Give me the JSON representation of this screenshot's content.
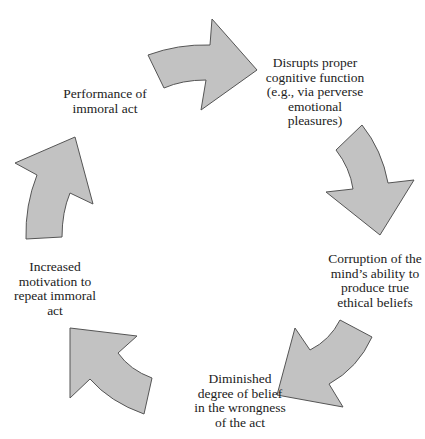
{
  "diagram": {
    "type": "cycle",
    "colors": {
      "arrow_fill": "#c2c2c2",
      "arrow_stroke": "#555555",
      "text": "#222222",
      "background": "#ffffff"
    },
    "nodes": [
      {
        "id": 0,
        "label": "Performance of\nimmoral act"
      },
      {
        "id": 1,
        "label": "Disrupts proper\ncognitive function\n(e.g., via perverse\nemotional\npleasures)"
      },
      {
        "id": 2,
        "label": "Corruption of the\nmind’s ability to\nproduce true\nethical beliefs"
      },
      {
        "id": 3,
        "label": "Diminished\ndegree of belief\nin the wrongness\nof the act"
      },
      {
        "id": 4,
        "label": "Increased\nmotivation to\nrepeat immoral\nact"
      }
    ],
    "edges": [
      {
        "from": 0,
        "to": 1,
        "shape": "curved-arrow",
        "direction": "right"
      },
      {
        "from": 1,
        "to": 2,
        "shape": "curved-arrow",
        "direction": "down"
      },
      {
        "from": 2,
        "to": 3,
        "shape": "curved-arrow",
        "direction": "down-left"
      },
      {
        "from": 3,
        "to": 4,
        "shape": "curved-arrow",
        "direction": "up-left"
      },
      {
        "from": 4,
        "to": 0,
        "shape": "curved-arrow",
        "direction": "up"
      }
    ]
  }
}
